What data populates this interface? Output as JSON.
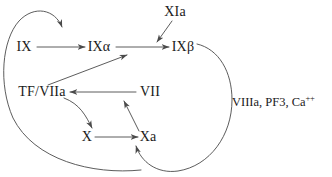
{
  "figure": {
    "type": "diagram",
    "background_color": "#ffffff",
    "line_color": "#4a4a4a",
    "text_color": "#1a1a1a"
  },
  "nodes": {
    "ix": {
      "label": "IX",
      "x": 24,
      "y": 47
    },
    "ix_alpha": {
      "label": "IXα",
      "x": 99,
      "y": 47
    },
    "ix_beta": {
      "label": "IXβ",
      "x": 183,
      "y": 47
    },
    "xia": {
      "label": "XIa",
      "x": 175,
      "y": 12
    },
    "tf_viia": {
      "label": "TF/VIIa",
      "x": 42,
      "y": 92
    },
    "vii": {
      "label": "VII",
      "x": 150,
      "y": 92
    },
    "x": {
      "label": "X",
      "x": 87,
      "y": 137
    },
    "xa": {
      "label": "Xa",
      "x": 148,
      "y": 137
    }
  },
  "cofactors": {
    "complex": {
      "text_main": "VIIIa, PF3, Ca",
      "text_superscript": "++",
      "x": 232,
      "y": 101
    }
  },
  "edges": [
    {
      "name": "ix-to-ix-alpha",
      "from": "IX",
      "to": "IXα",
      "style": "straight"
    },
    {
      "name": "ix-alpha-to-ix-beta",
      "from": "IXα",
      "to": "IXβ",
      "style": "straight"
    },
    {
      "name": "xia-to-ix-alpha-ix-beta",
      "from": "XIa",
      "to": "IXα → IXβ conversion",
      "style": "straight"
    },
    {
      "name": "feedback-loop-to-ix-conversion",
      "from": "Xa (bottom left loop)",
      "to": "IX → IXα conversion",
      "style": "curve"
    },
    {
      "name": "xa-loop-to-ix-alpha",
      "from": "Xa loop",
      "to": "IXα",
      "style": "straight-diagonal"
    },
    {
      "name": "vii-to-tf-viia",
      "from": "VII",
      "to": "TF/VIIa",
      "style": "straight"
    },
    {
      "name": "tf-viia-to-x",
      "from": "TF/VIIa",
      "to": "X",
      "style": "curve"
    },
    {
      "name": "x-to-xa",
      "from": "X",
      "to": "Xa",
      "style": "straight"
    },
    {
      "name": "xa-to-vii",
      "from": "Xa",
      "to": "VII",
      "style": "straight-diagonal"
    },
    {
      "name": "ix-beta-loop-to-xa",
      "from": "IXβ",
      "to": "Xa",
      "style": "curve"
    }
  ]
}
